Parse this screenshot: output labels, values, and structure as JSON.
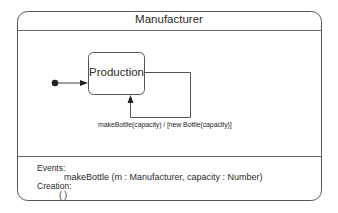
{
  "class_box": {
    "title": "Manufacturer"
  },
  "statechart": {
    "initial_state": "initial-pseudostate",
    "states": [
      {
        "name": "Production"
      }
    ],
    "transitions": [
      {
        "from": "initial",
        "to": "Production",
        "label": ""
      },
      {
        "from": "Production",
        "to": "Production",
        "label": "makeBottle(capacity) / [new  Bottle(capacity)]"
      }
    ]
  },
  "events_section": {
    "events_heading": "Events:",
    "events": [
      "makeBottle (m : Manufacturer, capacity : Number)"
    ],
    "creation_heading": "Creation:",
    "creation": [
      "( )"
    ]
  },
  "colors": {
    "line": "#555555",
    "text": "#2a2a2a",
    "background": "#ffffff"
  }
}
